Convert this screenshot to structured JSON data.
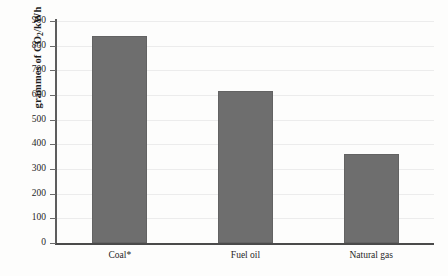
{
  "chart_data": {
    "type": "bar",
    "title": "",
    "xlabel": "",
    "ylabel": "grammes of CO2/kWh",
    "ylabel_prefix": "grammes of CO",
    "ylabel_sub": "2",
    "ylabel_suffix": "/kWh",
    "categories": [
      "Coal*",
      "Fuel oil",
      "Natural gas"
    ],
    "values": [
      840,
      615,
      360
    ],
    "ylim": [
      0,
      900
    ],
    "yticks": [
      0,
      100,
      200,
      300,
      400,
      500,
      600,
      700,
      800,
      900
    ],
    "ytick_labels": [
      "0",
      "100",
      "200",
      "300",
      "400",
      "500",
      "600",
      "700",
      "800",
      "900"
    ],
    "grid": true,
    "legend": false,
    "bar_color": "#6e6e6e",
    "bar_edge_color": "#636363",
    "axis_color": "#4a4a4a",
    "grid_color": "#ececec",
    "background": "#fdfdfc"
  }
}
